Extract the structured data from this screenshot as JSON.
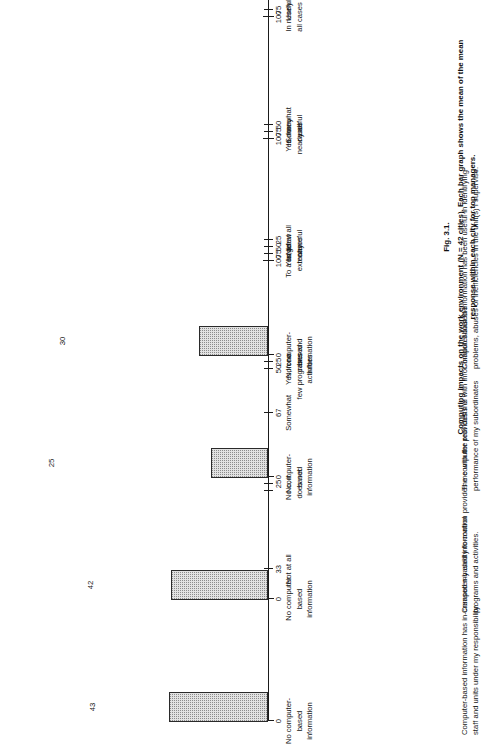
{
  "figure": {
    "number": "Fig. 3.1.",
    "caption": "Computing impacts on the work environment (N = 42 cities). Each bar graph shows the mean of the mean response within each city for top managers."
  },
  "chart_data": {
    "type": "bar",
    "title": "Computing impacts on the work environment (N = 42 cities). Each bar graph shows the mean of the mean response within each city for top managers.",
    "orientation": "vertical-bars-on-sideways-page",
    "grid": false,
    "legend": null,
    "panels": [
      {
        "id": "p0",
        "question": "Computer-based information has in-creased my ability to control staff and units under my responsibility.",
        "value": 43,
        "value_label": "43",
        "xlim": [
          0,
          100
        ],
        "ticks": [
          {
            "value": 0,
            "num": "0",
            "caption": "No computer-\nbased\ninformation"
          },
          {
            "value": 33,
            "num": "33",
            "caption": "Not at all"
          },
          {
            "value": 50,
            "num": "",
            "caption": ""
          },
          {
            "value": 67,
            "num": "67",
            "caption": "Somewhat"
          },
          {
            "value": 100,
            "num": "100",
            "caption": "To a large\nextent"
          }
        ]
      },
      {
        "id": "p1",
        "question": "Computer-based information provides me with the real costs of programs and activities.",
        "value": 42,
        "value_label": "42",
        "xlim": [
          0,
          100
        ],
        "ticks": [
          {
            "value": 0,
            "num": "0",
            "caption": "No computer\nbased\ninformation"
          },
          {
            "value": 25,
            "num": "25",
            "caption": "No, it\ndoes not"
          },
          {
            "value": 50,
            "num": "50",
            "caption": "Yes, for a\nfew programs and\nactivities"
          },
          {
            "value": 75,
            "num": "75",
            "caption": "Yes, for\nmany"
          },
          {
            "value": 100,
            "num": "100",
            "caption": "Yes, for\nnearly all"
          }
        ]
      },
      {
        "id": "p2",
        "question": "The computer provides me with infor-mation about the performance of my subordinates",
        "value": 25,
        "value_label": "25",
        "xlim": [
          0,
          100
        ],
        "ticks": [
          {
            "value": 0,
            "num": "0",
            "caption": "No computer-\nbased\ninformation"
          },
          {
            "value": 25,
            "num": "25",
            "caption": "In no\ncases"
          },
          {
            "value": 50,
            "num": "50",
            "caption": "In a few\ncases"
          },
          {
            "value": 75,
            "num": "75",
            "caption": "In many\ncases"
          },
          {
            "value": 100,
            "num": "100",
            "caption": "In nearly\nall cases"
          }
        ]
      },
      {
        "id": "p3",
        "question": "Computer-based information has been useful in identifying problems, abuses or inefficiencies in the unit(s) I supervise.",
        "value": 30,
        "value_label": "30",
        "xlim": [
          0,
          100
        ],
        "ticks": [
          {
            "value": 0,
            "num": "0",
            "caption": "No computer-\nbased\ninformation"
          },
          {
            "value": 25,
            "num": "25",
            "caption": "Not at all\nuseful"
          },
          {
            "value": 50,
            "num": "50",
            "caption": "Somewhat\nuseful"
          },
          {
            "value": 75,
            "num": "75",
            "caption": "Useful"
          },
          {
            "value": 100,
            "num": "100",
            "caption": "Very\nuseful"
          }
        ]
      }
    ]
  },
  "colors": {
    "bar_fill": "#e2e2e2",
    "bar_stroke": "#2a2a2a",
    "axis": "#1b1b1b",
    "text": "#141414",
    "background": "#ffffff"
  }
}
